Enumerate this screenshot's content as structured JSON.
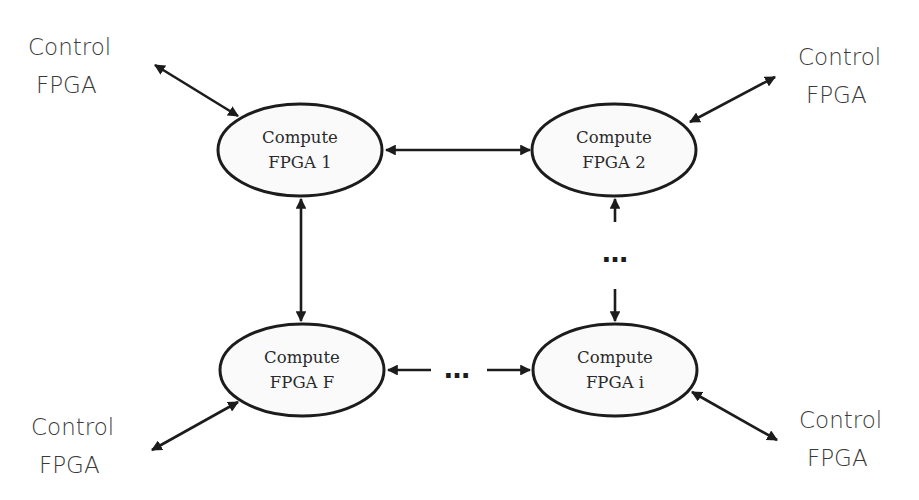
{
  "diagram": {
    "type": "network-topology",
    "colors": {
      "stroke": "#1c1c1c",
      "node_fill": "#fafafa",
      "text": "#2a2a2a",
      "control_text": "#3a3a3a"
    },
    "compute_nodes": [
      {
        "id": "fpga1",
        "line1": "Compute",
        "line2": "FPGA 1"
      },
      {
        "id": "fpga2",
        "line1": "Compute",
        "line2": "FPGA 2"
      },
      {
        "id": "fpgaF",
        "line1": "Compute",
        "line2": "FPGA F"
      },
      {
        "id": "fpgai",
        "line1": "Compute",
        "line2": "FPGA i"
      }
    ],
    "control_nodes": [
      {
        "id": "ctrl_tl",
        "line1": "Control",
        "line2": "FPGA"
      },
      {
        "id": "ctrl_tr",
        "line1": "Control",
        "line2": "FPGA"
      },
      {
        "id": "ctrl_bl",
        "line1": "Control",
        "line2": "FPGA"
      },
      {
        "id": "ctrl_br",
        "line1": "Control",
        "line2": "FPGA"
      }
    ],
    "ellipsis": "…",
    "edges": [
      {
        "from": "fpga1",
        "to": "fpga2",
        "type": "bidirectional"
      },
      {
        "from": "fpga1",
        "to": "fpgaF",
        "type": "bidirectional"
      },
      {
        "from": "fpga2",
        "to": "fpgai",
        "type": "bidirectional-elided"
      },
      {
        "from": "fpgaF",
        "to": "fpgai",
        "type": "bidirectional-elided"
      },
      {
        "from": "ctrl_tl",
        "to": "fpga1",
        "type": "bidirectional"
      },
      {
        "from": "ctrl_tr",
        "to": "fpga2",
        "type": "bidirectional"
      },
      {
        "from": "ctrl_bl",
        "to": "fpgaF",
        "type": "bidirectional"
      },
      {
        "from": "ctrl_br",
        "to": "fpgai",
        "type": "bidirectional"
      }
    ]
  }
}
